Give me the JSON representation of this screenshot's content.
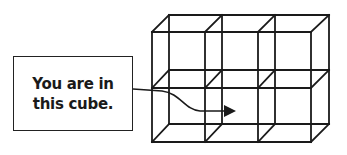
{
  "diagram": {
    "label": {
      "lines": [
        "You are in",
        "this cube."
      ]
    },
    "grid": {
      "columns": 3,
      "rows": 2,
      "description": "3×2 grid of wireframe cubes"
    },
    "colors": {
      "stroke": "#1a1a1a",
      "background": "#ffffff"
    }
  }
}
